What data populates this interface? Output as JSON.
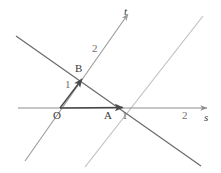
{
  "figure": {
    "type": "geometry-diagram",
    "title": "",
    "background_color": "#ffffff",
    "width": 221,
    "height": 173,
    "axes": [
      {
        "name": "s-axis",
        "label": "s",
        "label_style": "italic",
        "color": "#8d8d8d",
        "from": [
          18,
          108
        ],
        "to": [
          207,
          108
        ],
        "arrow": "end",
        "ticks": [
          {
            "label": "1",
            "at": [
              125,
              118
            ]
          },
          {
            "label": "2",
            "at": [
              186,
              118
            ]
          }
        ]
      },
      {
        "name": "t-axis",
        "label": "t",
        "label_style": "italic",
        "color": "#9a9a9a",
        "from": [
          25,
          161
        ],
        "to": [
          128,
          14
        ],
        "arrow": "end",
        "ticks": [
          {
            "label": "1",
            "at": [
              70,
              87
            ]
          },
          {
            "label": "2",
            "at": [
              97,
              51
            ]
          }
        ]
      }
    ],
    "lines": [
      {
        "name": "oblique-line-descending",
        "color": "#6a6a6a",
        "from": [
          16,
          36
        ],
        "to": [
          201,
          166
        ]
      },
      {
        "name": "oblique-line-parallel-to-t",
        "color": "#bdbdbd",
        "from": [
          85,
          167
        ],
        "to": [
          203,
          16
        ]
      }
    ],
    "vectors": [
      {
        "name": "vector-OA",
        "color": "#585858",
        "from": [
          60,
          108
        ],
        "to": [
          124,
          107
        ],
        "arrow": "end"
      },
      {
        "name": "vector-OB",
        "color": "#585858",
        "from": [
          60,
          108
        ],
        "to": [
          83,
          78
        ],
        "arrow": "end"
      }
    ],
    "points": [
      {
        "name": "point-O",
        "label": "O",
        "at": [
          60,
          108
        ],
        "label_at": [
          55,
          120
        ]
      },
      {
        "name": "point-A",
        "label": "A",
        "at": [
          109,
          108
        ],
        "label_at": [
          105,
          120
        ]
      },
      {
        "name": "point-B",
        "label": "B",
        "at": [
          83,
          78
        ],
        "label_at": [
          77,
          75
        ]
      }
    ],
    "labels": [
      {
        "name": "axis-label-t",
        "text": "t",
        "at": [
          124,
          12
        ],
        "italic": true,
        "light": false
      },
      {
        "name": "axis-label-s",
        "text": "s",
        "at": [
          205,
          119
        ],
        "italic": true,
        "light": false
      },
      {
        "name": "tick-label-t-2",
        "text": "2",
        "at": [
          93,
          46
        ],
        "italic": false,
        "light": true
      },
      {
        "name": "tick-label-t-1",
        "text": "1",
        "at": [
          66,
          82
        ],
        "italic": false,
        "light": true
      },
      {
        "name": "point-label-B",
        "text": "B",
        "at": [
          76,
          66
        ],
        "italic": false,
        "light": false
      },
      {
        "name": "point-label-O",
        "text": "O",
        "at": [
          54,
          112
        ],
        "italic": false,
        "light": false
      },
      {
        "name": "point-label-A",
        "text": "A",
        "at": [
          105,
          112
        ],
        "italic": false,
        "light": false
      },
      {
        "name": "tick-label-s-1",
        "text": "1",
        "at": [
          123,
          112
        ],
        "italic": false,
        "light": true
      },
      {
        "name": "tick-label-s-2",
        "text": "2",
        "at": [
          183,
          112
        ],
        "italic": false,
        "light": true
      }
    ]
  }
}
